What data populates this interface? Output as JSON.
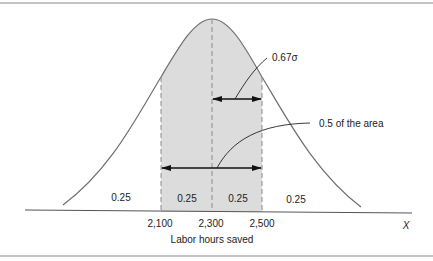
{
  "diagram": {
    "type": "normal-distribution",
    "colors": {
      "border": "#8a8a8a",
      "curve": "#6e6e6e",
      "shade": "#dcdcdc",
      "dash": "#8a8a8a",
      "arrow": "#111111",
      "text": "#222222"
    },
    "annotations": {
      "sigma_label": "0.67σ",
      "area_label": "0.5 of the area"
    },
    "region_labels": [
      "0.25",
      "0.25",
      "0.25",
      "0.25"
    ],
    "x_ticks": [
      "2,100",
      "2,300",
      "2,500"
    ],
    "x_axis_label": "Labor hours saved",
    "x_axis_variable": "X"
  }
}
